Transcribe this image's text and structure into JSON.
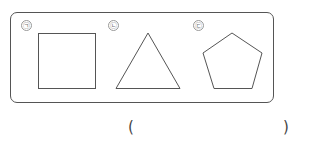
{
  "problem": {
    "items": [
      {
        "label": "㉠",
        "shape": "square"
      },
      {
        "label": "㉡",
        "shape": "triangle"
      },
      {
        "label": "㉢",
        "shape": "pentagon"
      }
    ],
    "answer": {
      "open_paren": "(",
      "close_paren": ")",
      "value": ""
    }
  },
  "colors": {
    "stroke": "#555555",
    "label_circle": "#999999"
  }
}
